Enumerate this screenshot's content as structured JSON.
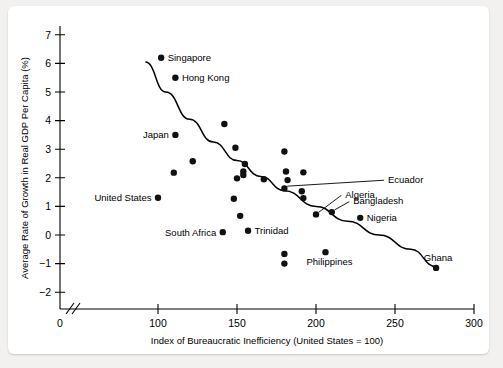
{
  "chart_data": {
    "type": "scatter",
    "title": "",
    "xlabel": "Index of Bureaucratic Inefficiency (United States = 100)",
    "ylabel": "Average Rate of Growth in Real GDP Per Capita (%)",
    "xlim": [
      90,
      305
    ],
    "ylim": [
      -2.4,
      7.3
    ],
    "xticks": [
      0,
      100,
      150,
      200,
      250,
      300
    ],
    "xtick_labels": [
      "0",
      "100",
      "150",
      "200",
      "250",
      "300"
    ],
    "yticks": [
      -2,
      -1,
      0,
      1,
      2,
      3,
      4,
      5,
      6,
      7
    ],
    "ytick_labels": [
      "−2",
      "−1",
      "0",
      "1",
      "2",
      "3",
      "4",
      "5",
      "6",
      "7"
    ],
    "grid": false,
    "legend": "none",
    "axis_break_x": true,
    "points": [
      {
        "label": "Singapore",
        "x": 102,
        "y": 6.2,
        "label_pos": "right"
      },
      {
        "label": "Hong Kong",
        "x": 111,
        "y": 5.5,
        "label_pos": "right"
      },
      {
        "label": "Japan",
        "x": 111,
        "y": 3.5,
        "label_pos": "left"
      },
      {
        "label": "United States",
        "x": 100,
        "y": 1.3,
        "label_pos": "left"
      },
      {
        "label": "South Africa",
        "x": 141,
        "y": 0.1,
        "label_pos": "left"
      },
      {
        "label": "Trinidad",
        "x": 157,
        "y": 0.15,
        "label_pos": "right"
      },
      {
        "label": "Nigeria",
        "x": 228,
        "y": 0.6,
        "label_pos": "right"
      },
      {
        "label": "Ghana",
        "x": 276,
        "y": -1.15,
        "label_pos": "above"
      },
      {
        "label": "Philippines",
        "x": 206,
        "y": -0.6,
        "label_pos": "below"
      },
      {
        "label": "Ecuador",
        "x": 180,
        "y": 1.63,
        "label_pos": "leader",
        "leader_to_x": 243,
        "leader_to_y": 1.95
      },
      {
        "label": "Algeria",
        "x": 200,
        "y": 0.72,
        "label_pos": "leader",
        "leader_to_x": 216,
        "leader_to_y": 1.42
      },
      {
        "label": "Bangladesh",
        "x": 210,
        "y": 0.8,
        "label_pos": "leader",
        "leader_to_x": 221,
        "leader_to_y": 1.2
      },
      {
        "label": "",
        "x": 142,
        "y": 3.88
      },
      {
        "label": "",
        "x": 122,
        "y": 2.58
      },
      {
        "label": "",
        "x": 110,
        "y": 2.18
      },
      {
        "label": "",
        "x": 149,
        "y": 3.05
      },
      {
        "label": "",
        "x": 155,
        "y": 2.48
      },
      {
        "label": "",
        "x": 154,
        "y": 2.22
      },
      {
        "label": "",
        "x": 154,
        "y": 2.1
      },
      {
        "label": "",
        "x": 150,
        "y": 1.98
      },
      {
        "label": "",
        "x": 167,
        "y": 1.95
      },
      {
        "label": "",
        "x": 180,
        "y": 2.92
      },
      {
        "label": "",
        "x": 181,
        "y": 2.22
      },
      {
        "label": "",
        "x": 192,
        "y": 2.19
      },
      {
        "label": "",
        "x": 182,
        "y": 1.92
      },
      {
        "label": "",
        "x": 191,
        "y": 1.53
      },
      {
        "label": "",
        "x": 192,
        "y": 1.29
      },
      {
        "label": "",
        "x": 148,
        "y": 1.27
      },
      {
        "label": "",
        "x": 152,
        "y": 0.67
      },
      {
        "label": "",
        "x": 180,
        "y": -0.66
      },
      {
        "label": "",
        "x": 180,
        "y": -1.0
      }
    ],
    "trend_line": {
      "description": "downward-sloping fitted curve",
      "points": [
        {
          "x": 92,
          "y": 6.05
        },
        {
          "x": 105,
          "y": 5.0
        },
        {
          "x": 120,
          "y": 4.05
        },
        {
          "x": 135,
          "y": 3.25
        },
        {
          "x": 150,
          "y": 2.6
        },
        {
          "x": 165,
          "y": 2.05
        },
        {
          "x": 180,
          "y": 1.55
        },
        {
          "x": 200,
          "y": 1.0
        },
        {
          "x": 220,
          "y": 0.48
        },
        {
          "x": 240,
          "y": 0.0
        },
        {
          "x": 260,
          "y": -0.5
        },
        {
          "x": 276,
          "y": -1.1
        }
      ]
    }
  }
}
